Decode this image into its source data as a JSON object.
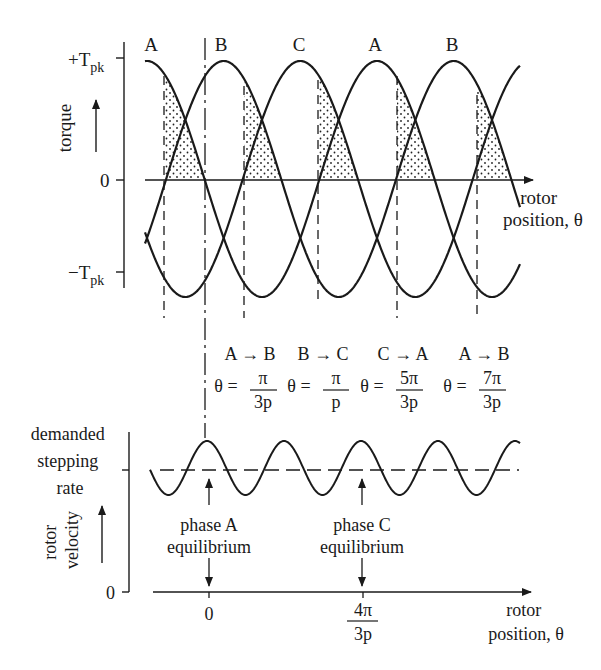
{
  "top_plot": {
    "y_axis_label": "torque",
    "y_ticks": [
      {
        "label_main": "+T",
        "label_sub": "pk",
        "value": 1
      },
      {
        "label_main": "0",
        "label_sub": "",
        "value": 0
      },
      {
        "label_main": "−T",
        "label_sub": "pk",
        "value": -1
      }
    ],
    "x_axis_label_line1": "rotor",
    "x_axis_label_line2": "position, θ",
    "phase_labels": [
      "A",
      "B",
      "C",
      "A",
      "B"
    ],
    "transitions": [
      {
        "label": "A → B",
        "theta_num": "π",
        "theta_den": "3p"
      },
      {
        "label": "B → C",
        "theta_num": "π",
        "theta_den": "p"
      },
      {
        "label": "C → A",
        "theta_num": "5π",
        "theta_den": "3p"
      },
      {
        "label": "A → B",
        "theta_num": "7π",
        "theta_den": "3p"
      }
    ],
    "theta_prefix": "θ ="
  },
  "bottom_plot": {
    "demanded_line1": "demanded",
    "demanded_line2": "stepping",
    "demanded_line3": "rate",
    "y_axis_label_line1": "rotor",
    "y_axis_label_line2": "velocity",
    "y_zero": "0",
    "x_tick_zero": "0",
    "x_tick_num": "4π",
    "x_tick_den": "3p",
    "annotations": [
      {
        "line1": "phase A",
        "line2": "equilibrium"
      },
      {
        "line1": "phase C",
        "line2": "equilibrium"
      }
    ],
    "x_axis_label_line1": "rotor",
    "x_axis_label_line2": "position, θ"
  },
  "chart_data": [
    {
      "type": "line",
      "title": "Static torque curves of three-phase stepper (phases A, B, C)",
      "ylabel": "torque",
      "xlabel": "rotor position, θ",
      "yticks": [
        "+Tpk",
        "0",
        "−Tpk"
      ],
      "series": [
        {
          "name": "A",
          "shape": "sinusoid",
          "peaks_at_labels": [
            "A"
          ]
        },
        {
          "name": "B",
          "shape": "sinusoid",
          "phase_shift": "2π/3p"
        },
        {
          "name": "C",
          "shape": "sinusoid",
          "phase_shift": "4π/3p"
        }
      ],
      "switching_points": [
        "π/3p",
        "π/p",
        "5π/3p",
        "7π/3p"
      ],
      "switching_transitions": [
        "A→B",
        "B→C",
        "C→A",
        "A→B"
      ],
      "shaded_region": "dotted area under active-phase torque between switching points"
    },
    {
      "type": "line",
      "title": "Rotor velocity oscillation about demanded stepping rate",
      "ylabel": "rotor velocity",
      "xlabel": "rotor position, θ",
      "x_ticks": [
        "0",
        "4π/3p"
      ],
      "reference_line": "demanded stepping rate (dashed)",
      "annotations": [
        "phase A equilibrium at θ=0",
        "phase C equilibrium at θ=4π/3p"
      ]
    }
  ]
}
